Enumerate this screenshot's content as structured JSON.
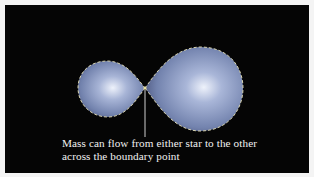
{
  "figure": {
    "caption_lines": [
      "Mass can flow from either star to the other",
      "across the boundary point"
    ],
    "colors": {
      "background": "#050505",
      "lobe_fill_light": "#e6ecf8",
      "lobe_fill_mid": "#8c9cc4",
      "lobe_fill_dark": "#5a6690",
      "boundary_dash": "#d8d4b0",
      "pointer_line": "#cfcfcf",
      "caption_text": "#f2f2f2"
    },
    "lobes": [
      {
        "name": "smaller-star-lobe"
      },
      {
        "name": "larger-star-lobe"
      }
    ]
  }
}
